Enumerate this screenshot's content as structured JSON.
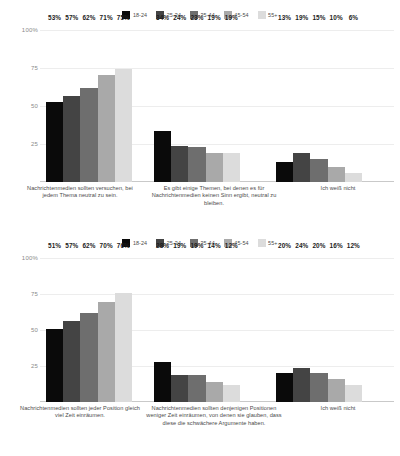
{
  "legend": {
    "items": [
      {
        "label": "18-24",
        "color": "#0a0a0a"
      },
      {
        "label": "25-34",
        "color": "#444444"
      },
      {
        "label": "35-44",
        "color": "#6e6e6e"
      },
      {
        "label": "45-54",
        "color": "#a9a9a9"
      },
      {
        "label": "55+",
        "color": "#dcdcdc"
      }
    ]
  },
  "axis": {
    "tick_100": "100%",
    "tick_75": "75",
    "tick_50": "50",
    "tick_25": "25"
  },
  "chart_data": [
    {
      "type": "bar",
      "title": "",
      "xlabel": "",
      "ylabel": "",
      "ylim": [
        0,
        100
      ],
      "grid": true,
      "legend_position": "top",
      "ytick_labels": [
        "100%",
        "75",
        "50",
        "25"
      ],
      "ytick_values": [
        100,
        75,
        50,
        25
      ],
      "categories": [
        "Nachrichtenmedien sollten versuchen, bei jedem Thema neutral zu sein.",
        "Es gibt einige Themen, bei denen es für Nachrichtenmedien keinen Sinn ergibt, neutral zu bleiben.",
        "Ich weiß nicht"
      ],
      "series": [
        {
          "name": "18-24",
          "color": "#0a0a0a",
          "values": [
            53,
            34,
            13
          ],
          "labels": [
            "53%",
            "34%",
            "13%"
          ]
        },
        {
          "name": "25-34",
          "color": "#444444",
          "values": [
            57,
            24,
            19
          ],
          "labels": [
            "57%",
            "24%",
            "19%"
          ]
        },
        {
          "name": "35-44",
          "color": "#6e6e6e",
          "values": [
            62,
            23,
            15
          ],
          "labels": [
            "62%",
            "23%",
            "15%"
          ]
        },
        {
          "name": "45-54",
          "color": "#a9a9a9",
          "values": [
            71,
            19,
            10
          ],
          "labels": [
            "71%",
            "19%",
            "10%"
          ]
        },
        {
          "name": "55+",
          "color": "#dcdcdc",
          "values": [
            75,
            19,
            6
          ],
          "labels": [
            "75%",
            "19%",
            "6%"
          ]
        }
      ]
    },
    {
      "type": "bar",
      "title": "",
      "xlabel": "",
      "ylabel": "",
      "ylim": [
        0,
        100
      ],
      "grid": true,
      "legend_position": "top",
      "ytick_labels": [
        "100%",
        "75",
        "50",
        "25"
      ],
      "ytick_values": [
        100,
        75,
        50,
        25
      ],
      "categories": [
        "Nachrichtenmedien sollten jeder Position gleich viel Zeit einräumen.",
        "Nachrichtenmedien sollten denjenigen Positionen weniger Zeit einräumen, von denen sie glauben, dass diese die schwächere Argumente haben.",
        "Ich weiß nicht"
      ],
      "series": [
        {
          "name": "18-24",
          "color": "#0a0a0a",
          "values": [
            51,
            28,
            20
          ],
          "labels": [
            "51%",
            "28%",
            "20%"
          ]
        },
        {
          "name": "25-34",
          "color": "#444444",
          "values": [
            57,
            19,
            24
          ],
          "labels": [
            "57%",
            "19%",
            "24%"
          ]
        },
        {
          "name": "35-44",
          "color": "#6e6e6e",
          "values": [
            62,
            19,
            20
          ],
          "labels": [
            "62%",
            "19%",
            "20%"
          ]
        },
        {
          "name": "45-54",
          "color": "#a9a9a9",
          "values": [
            70,
            14,
            16
          ],
          "labels": [
            "70%",
            "14%",
            "16%"
          ]
        },
        {
          "name": "55+",
          "color": "#dcdcdc",
          "values": [
            76,
            12,
            12
          ],
          "labels": [
            "76%",
            "12%",
            "12%"
          ]
        }
      ]
    }
  ]
}
